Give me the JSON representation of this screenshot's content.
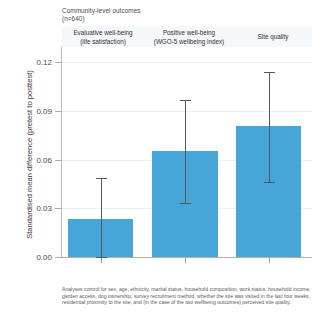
{
  "chart_data": {
    "type": "bar",
    "title": "Community-level outcomes\n(n=640)",
    "title_main": "Community-level outcomes",
    "title_sub": "(n=640)",
    "xlabel": "",
    "ylabel": "Standardised mean difference (pretest to posttest)",
    "ylim": [
      0.0,
      0.1295
    ],
    "yticks": [
      0.0,
      0.03,
      0.06,
      0.09,
      0.12
    ],
    "ytick_labels": [
      "0.00",
      "0.03",
      "0.06",
      "0.09",
      "0.12"
    ],
    "grid": true,
    "legend": "none",
    "categories": [
      "Evaluative well-being\n(life satisfaction)",
      "Positive well-being\n(WGO-5 wellbeing index)",
      "Site quality"
    ],
    "values": [
      0.0235,
      0.0653,
      0.0806
    ],
    "errors_low": [
      0.0002,
      0.0335,
      0.0465
    ],
    "errors_high": [
      0.0488,
      0.0971,
      0.1141
    ],
    "bar_color": "#47a6d9",
    "error_color": "#55585a",
    "header_band_color": "#f4f8fa",
    "series": [
      {
        "name": "Standardised mean difference",
        "values": [
          0.0235,
          0.0653,
          0.0806
        ]
      }
    ],
    "footnote": "Analyses control for sex, age, ethnicity, marital status, household composition, work status, household income, garden access, dog ownership, survey recruitment method, whether the site was visited in the last four weeks, residential proximity to the site, and (in the case of the two wellbeing outcomes) perceived site quality."
  }
}
